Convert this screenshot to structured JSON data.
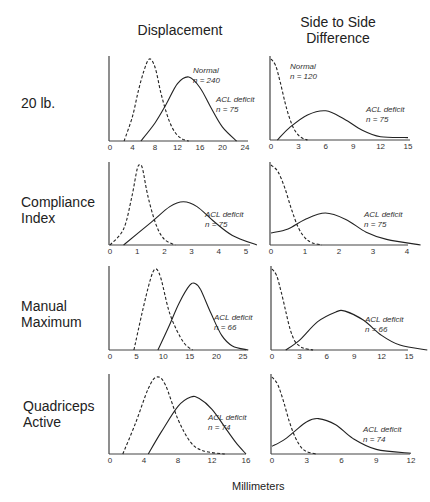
{
  "columns": [
    "Displacement",
    "Side to Side Difference"
  ],
  "column_titles": {
    "left": "Displacement",
    "right_line1": "Side to Side",
    "right_line2": "Difference"
  },
  "rows": [
    {
      "line1": "20 lb.",
      "line2": ""
    },
    {
      "line1": "Compliance",
      "line2": "Index"
    },
    {
      "line1": "Manual",
      "line2": "Maximum"
    },
    {
      "line1": "Quadriceps",
      "line2": "Active"
    }
  ],
  "xlabel": "Millimeters",
  "chart_data": [
    {
      "type": "line",
      "title": "20 lb. — Displacement",
      "xlabel": "Millimeters",
      "xticks": [
        0,
        4,
        8,
        12,
        16,
        20,
        24
      ],
      "xlim": [
        0,
        24
      ],
      "series": [
        {
          "name": "Normal",
          "n": 240,
          "style": "dashed",
          "x": [
            2.5,
            4,
            5,
            6,
            7,
            8,
            9,
            10,
            11,
            12,
            13,
            14
          ],
          "y": [
            0,
            0.3,
            0.6,
            0.85,
            1.0,
            0.9,
            0.6,
            0.35,
            0.17,
            0.07,
            0.02,
            0
          ]
        },
        {
          "name": "ACL deficit",
          "n": 75,
          "style": "solid",
          "x": [
            5.5,
            8,
            10,
            12,
            14,
            16,
            18,
            20,
            22.5
          ],
          "y": [
            0,
            0.22,
            0.45,
            0.7,
            0.78,
            0.65,
            0.4,
            0.17,
            0
          ]
        }
      ],
      "annotations": [
        {
          "text": "Normal",
          "sub": "n = 240"
        },
        {
          "text": "ACL deficit",
          "sub": "n = 75"
        }
      ]
    },
    {
      "type": "line",
      "title": "20 lb. — Side to Side Difference",
      "xlabel": "Millimeters",
      "xticks": [
        0,
        3,
        6,
        9,
        12,
        15
      ],
      "xlim": [
        0,
        15
      ],
      "series": [
        {
          "name": "Normal",
          "n": 120,
          "style": "dashed",
          "x": [
            0,
            0.5,
            1,
            1.5,
            2,
            2.5,
            3,
            3.5,
            4
          ],
          "y": [
            1.0,
            0.92,
            0.72,
            0.48,
            0.28,
            0.14,
            0.06,
            0.02,
            0
          ]
        },
        {
          "name": "ACL deficit",
          "n": 75,
          "style": "solid",
          "x": [
            0.7,
            2,
            4,
            6,
            8,
            10,
            12,
            15
          ],
          "y": [
            0,
            0.15,
            0.31,
            0.36,
            0.26,
            0.12,
            0.04,
            0.03
          ]
        }
      ],
      "annotations": [
        {
          "text": "Normal",
          "sub": "n = 120"
        },
        {
          "text": "ACL deficit",
          "sub": "n = 75"
        }
      ]
    },
    {
      "type": "line",
      "title": "Compliance Index — Displacement",
      "xlabel": "Millimeters",
      "xticks": [
        0,
        1,
        2,
        3,
        4,
        5
      ],
      "xlim": [
        0,
        6
      ],
      "series": [
        {
          "name": "Normal",
          "style": "dashed",
          "x": [
            0,
            0.5,
            0.8,
            1.0,
            1.1,
            1.2,
            1.4,
            1.7,
            2.0,
            2.4
          ],
          "y": [
            0,
            0.2,
            0.6,
            0.95,
            1.0,
            0.95,
            0.6,
            0.25,
            0.07,
            0
          ]
        },
        {
          "name": "ACL deficit",
          "n": 75,
          "style": "solid",
          "x": [
            0.5,
            1.5,
            2.2,
            2.7,
            3.2,
            3.8,
            4.5,
            5.4
          ],
          "y": [
            0,
            0.28,
            0.48,
            0.54,
            0.48,
            0.3,
            0.12,
            0
          ]
        }
      ],
      "annotations": [
        {
          "text": "ACL deficit",
          "sub": "n = 75"
        }
      ]
    },
    {
      "type": "line",
      "title": "Compliance Index — Side to Side Difference",
      "xlabel": "Millimeters",
      "xticks": [
        0,
        1,
        2,
        3,
        4
      ],
      "xlim": [
        0,
        4.5
      ],
      "series": [
        {
          "name": "Normal",
          "style": "dashed",
          "x": [
            0,
            0.2,
            0.4,
            0.6,
            0.8,
            1.0,
            1.2,
            1.5
          ],
          "y": [
            1.0,
            0.92,
            0.72,
            0.45,
            0.22,
            0.09,
            0.03,
            0
          ]
        },
        {
          "name": "ACL deficit",
          "n": 75,
          "style": "solid",
          "x": [
            0,
            0.5,
            1.0,
            1.6,
            2.2,
            2.8,
            3.4,
            4.4
          ],
          "y": [
            0.15,
            0.2,
            0.32,
            0.4,
            0.32,
            0.16,
            0.07,
            0
          ]
        }
      ],
      "annotations": [
        {
          "text": "ACL deficit",
          "sub": "n = 75"
        }
      ]
    },
    {
      "type": "line",
      "title": "Manual Maximum — Displacement",
      "xlabel": "Millimeters",
      "xticks": [
        0,
        5,
        10,
        15,
        20,
        25
      ],
      "xlim": [
        0,
        28
      ],
      "series": [
        {
          "name": "Normal",
          "style": "dashed",
          "x": [
            4.5,
            6,
            7.5,
            8.5,
            9.5,
            11,
            12.5,
            14,
            15.5
          ],
          "y": [
            0,
            0.45,
            0.85,
            1.0,
            0.9,
            0.5,
            0.25,
            0.08,
            0
          ]
        },
        {
          "name": "ACL deficit",
          "n": 66,
          "style": "solid",
          "x": [
            9,
            11,
            13,
            15,
            16,
            17,
            19,
            21,
            23,
            26
          ],
          "y": [
            0,
            0.28,
            0.58,
            0.8,
            0.82,
            0.75,
            0.45,
            0.18,
            0.05,
            0
          ]
        }
      ],
      "annotations": [
        {
          "text": "ACL deficit",
          "sub": "n = 66"
        }
      ]
    },
    {
      "type": "line",
      "title": "Manual Maximum — Side to Side Difference",
      "xlabel": "Millimeters",
      "xticks": [
        0,
        3,
        6,
        9,
        12,
        15
      ],
      "xlim": [
        0,
        18
      ],
      "series": [
        {
          "name": "Normal",
          "style": "dashed",
          "x": [
            0,
            0.5,
            1,
            1.5,
            2,
            2.5,
            3,
            3.5,
            4.5
          ],
          "y": [
            1.0,
            0.92,
            0.72,
            0.48,
            0.25,
            0.11,
            0.05,
            0.02,
            0
          ]
        },
        {
          "name": "ACL deficit",
          "n": 66,
          "style": "solid",
          "x": [
            1.5,
            3,
            5,
            7,
            8,
            10,
            12,
            14,
            17
          ],
          "y": [
            0,
            0.12,
            0.35,
            0.47,
            0.48,
            0.37,
            0.18,
            0.06,
            0
          ]
        }
      ],
      "annotations": [
        {
          "text": "ACL deficit",
          "sub": "n = 66"
        }
      ]
    },
    {
      "type": "line",
      "title": "Quadriceps Active — Displacement",
      "xlabel": "Millimeters",
      "xticks": [
        0,
        4,
        8,
        12,
        16
      ],
      "xlim": [
        0,
        20
      ],
      "series": [
        {
          "name": "Normal",
          "style": "dashed",
          "x": [
            1.5,
            3,
            4.5,
            5.5,
            6.5,
            8,
            9.5,
            11,
            13.5
          ],
          "y": [
            0,
            0.4,
            0.85,
            1.0,
            0.9,
            0.45,
            0.15,
            0.04,
            0
          ]
        },
        {
          "name": "ACL deficit",
          "n": 74,
          "style": "solid",
          "x": [
            4.5,
            6,
            8,
            9.5,
            10.5,
            12,
            13.5,
            14.8,
            16
          ],
          "y": [
            0,
            0.28,
            0.62,
            0.74,
            0.72,
            0.58,
            0.35,
            0.15,
            0
          ]
        }
      ],
      "annotations": [
        {
          "text": "ACL deficit",
          "sub": "n = 74"
        }
      ]
    },
    {
      "type": "line",
      "title": "Quadriceps Active — Side to Side Difference",
      "xlabel": "Millimeters",
      "xticks": [
        0,
        3,
        6,
        9,
        12
      ],
      "xlim": [
        0,
        13
      ],
      "series": [
        {
          "name": "Normal",
          "style": "dashed",
          "x": [
            0,
            0.5,
            1,
            1.5,
            2,
            2.5,
            3,
            3.8
          ],
          "y": [
            1.0,
            0.9,
            0.68,
            0.42,
            0.22,
            0.09,
            0.03,
            0
          ]
        },
        {
          "name": "ACL deficit",
          "n": 74,
          "style": "solid",
          "x": [
            0,
            1,
            2,
            3,
            4,
            5.5,
            7,
            9,
            12
          ],
          "y": [
            0.1,
            0.18,
            0.3,
            0.42,
            0.46,
            0.38,
            0.2,
            0.06,
            0.01
          ]
        }
      ],
      "annotations": [
        {
          "text": "ACL deficit",
          "sub": "n = 74"
        }
      ]
    }
  ]
}
